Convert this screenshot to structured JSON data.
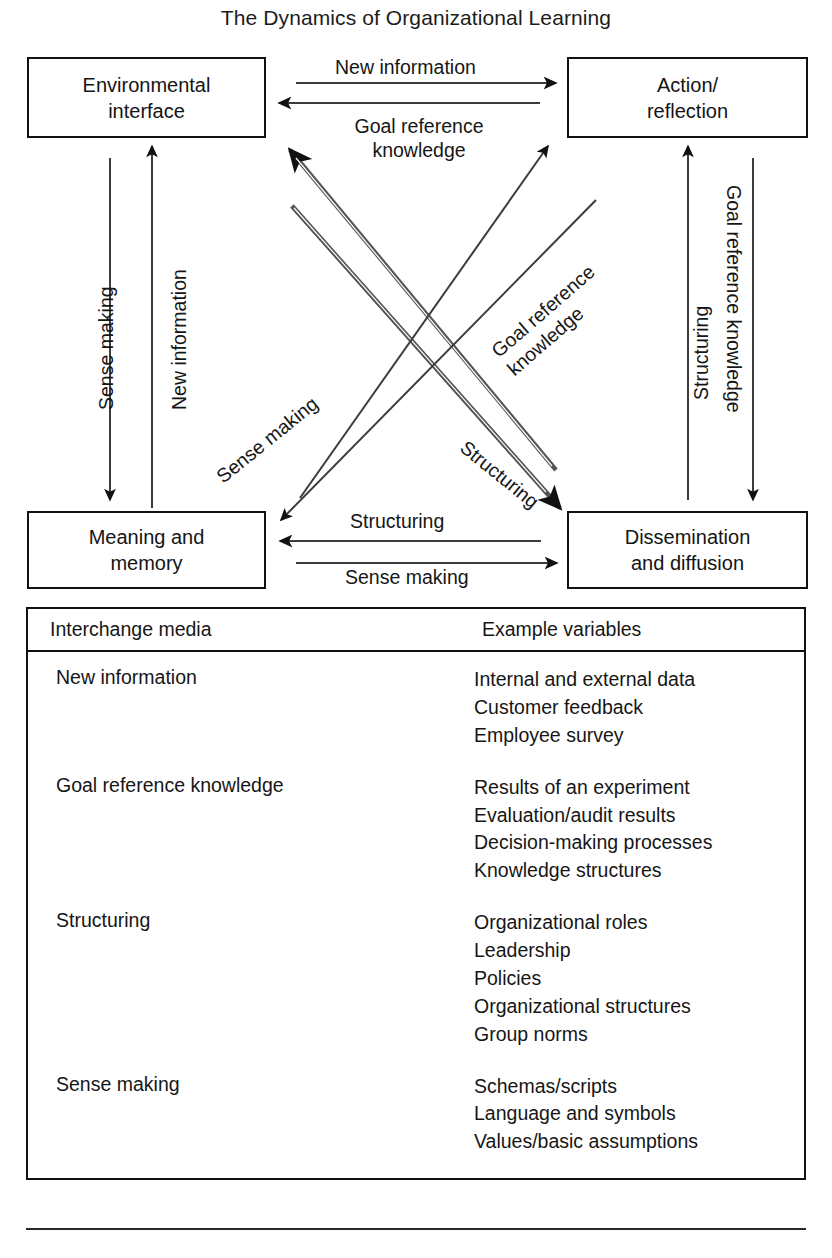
{
  "figure": {
    "title": "The Dynamics of Organizational Learning"
  },
  "nodes": {
    "environmental_interface": {
      "line1": "Environmental",
      "line2": "interface"
    },
    "action_reflection": {
      "line1": "Action/",
      "line2": "reflection"
    },
    "meaning_memory": {
      "line1": "Meaning and",
      "line2": "memory"
    },
    "dissemination_diffusion": {
      "line1": "Dissemination",
      "line2": "and diffusion"
    }
  },
  "edge_labels": {
    "top_right_arrow": "New information",
    "top_left_arrow_line1": "Goal reference",
    "top_left_arrow_line2": "knowledge",
    "bottom_left_arrow": "Structuring",
    "bottom_right_arrow": "Sense making",
    "left_down_arrow": "Sense making",
    "left_up_arrow": "New information",
    "right_up_arrow": "Structuring",
    "right_down_arrow": "Goal reference knowledge",
    "diagonal_sense_making": "Sense making",
    "diagonal_structuring": "Structuring",
    "diagonal_goal_ref_line1": "Goal reference",
    "diagonal_goal_ref_line2": "knowledge"
  },
  "legend": {
    "headers": [
      "Interchange media",
      "Example variables"
    ],
    "rows": [
      {
        "media": "New information",
        "variables": [
          "Internal and external data",
          "Customer feedback",
          "Employee survey"
        ]
      },
      {
        "media": "Goal reference knowledge",
        "variables": [
          "Results of an experiment",
          "Evaluation/audit results",
          "Decision-making processes",
          "Knowledge structures"
        ]
      },
      {
        "media": "Structuring",
        "variables": [
          "Organizational roles",
          "Leadership",
          "Policies",
          "Organizational structures",
          "Group norms"
        ]
      },
      {
        "media": "Sense making",
        "variables": [
          "Schemas/scripts",
          "Language and symbols",
          "Values/basic assumptions"
        ]
      }
    ]
  },
  "colors": {
    "ink": "#141414",
    "line": "#3a3a3a",
    "background": "#ffffff"
  }
}
